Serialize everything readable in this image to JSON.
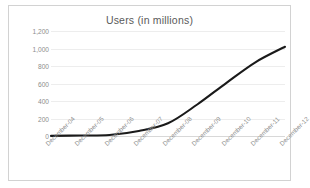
{
  "chart_data": {
    "type": "line",
    "title": "Users (in millions)",
    "xlabel": "",
    "ylabel": "",
    "categories": [
      "December-04",
      "December-05",
      "December-06",
      "December-07",
      "December-08",
      "December-09",
      "December-10",
      "December-11",
      "December-12"
    ],
    "series": [
      {
        "name": "Users",
        "values": [
          1,
          6,
          12,
          58,
          145,
          360,
          608,
          845,
          1020
        ]
      }
    ],
    "ylim": [
      0,
      1200
    ],
    "yticks": [
      0,
      200,
      400,
      600,
      800,
      1000,
      1200
    ],
    "ytick_labels": [
      "0",
      "200",
      "400",
      "600",
      "800",
      "1,000",
      "1,200"
    ],
    "grid": true,
    "legend": false,
    "legend_position": "none",
    "line_color": "#1a1a1a",
    "grid_color": "#ededed",
    "axis_color": "#d8d8d8",
    "tick_label_color": "#8d8d8d",
    "title_color": "#5a5a5a",
    "border_color": "#d2d2d2",
    "background_color": "#ffffff",
    "xtick_rotation": -45
  }
}
